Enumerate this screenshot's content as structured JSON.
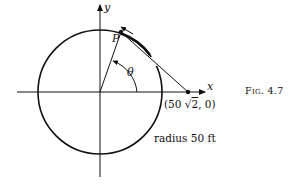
{
  "figure": {
    "caption": "Fig. 4.7",
    "axes": {
      "x_label": "x",
      "y_label": "y"
    },
    "point_P": {
      "label": "P"
    },
    "angle": {
      "label": "θ"
    },
    "fixed_point": {
      "label_prefix": "(50 ",
      "sqrt_symbol": "√",
      "sqrt_arg": "2",
      "label_suffix": ", 0)"
    },
    "radius_label": "radius 50 ft",
    "colors": {
      "ink": "#111111",
      "background": "#ffffff"
    }
  }
}
